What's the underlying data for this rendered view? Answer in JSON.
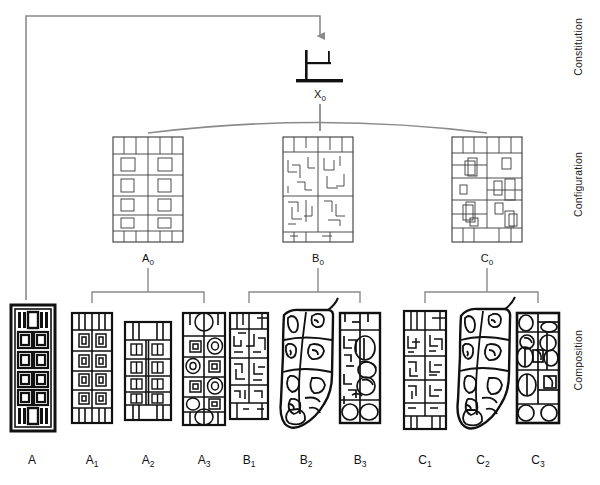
{
  "diagram": {
    "stroke_gray": "#8a8a8a",
    "stroke_dark": "#1a1a1a",
    "background": "#ffffff"
  },
  "levels": [
    {
      "key": "constitution",
      "label": "Constitution",
      "x": 574,
      "y": 18,
      "height": 96
    },
    {
      "key": "configuration",
      "label": "Configuration",
      "x": 574,
      "y": 152,
      "height": 98
    },
    {
      "key": "composition",
      "label": "Composition",
      "x": 574,
      "y": 330,
      "height": 92
    }
  ],
  "root": {
    "name": "X0",
    "label": "X",
    "subscript": "0",
    "label_x": 320,
    "label_y": 90,
    "glyph_x": 320,
    "glyph_y": 68
  },
  "configuration_nodes": [
    {
      "name": "A0",
      "label": "A",
      "subscript": "0",
      "cx": 148,
      "label_y": 258,
      "panel_x": 113,
      "panel_y": 137,
      "panel_w": 70,
      "panel_h": 105,
      "style": "orthogonal-regular"
    },
    {
      "name": "B0",
      "label": "B",
      "subscript": "0",
      "cx": 318,
      "label_y": 258,
      "panel_x": 283,
      "panel_y": 137,
      "panel_w": 70,
      "panel_h": 105,
      "style": "orthogonal-irregular"
    },
    {
      "name": "C0",
      "label": "C",
      "subscript": "0",
      "cx": 487,
      "label_y": 258,
      "panel_x": 452,
      "panel_y": 137,
      "panel_w": 70,
      "panel_h": 105,
      "style": "orthogonal-mixed"
    }
  ],
  "composition_nodes": [
    {
      "name": "A",
      "label": "A",
      "subscript": "",
      "cx": 32,
      "panel_x": 11,
      "panel_y": 305,
      "panel_w": 44,
      "panel_h": 126,
      "style": "bold-nested",
      "parent": null,
      "label_y": 458
    },
    {
      "name": "A1",
      "label": "A",
      "subscript": "1",
      "cx": 92,
      "panel_x": 72,
      "panel_y": 313,
      "panel_w": 40,
      "panel_h": 110,
      "style": "rect-grid",
      "parent": "A0",
      "label_y": 458
    },
    {
      "name": "A2",
      "label": "A",
      "subscript": "2",
      "cx": 148,
      "panel_x": 125,
      "panel_y": 322,
      "panel_w": 46,
      "panel_h": 98,
      "style": "rect-grid-split",
      "parent": "A0",
      "label_y": 458
    },
    {
      "name": "A3",
      "label": "A",
      "subscript": "3",
      "cx": 204,
      "panel_x": 183,
      "panel_y": 313,
      "panel_w": 42,
      "panel_h": 112,
      "style": "rect-oval-mix",
      "parent": "A0",
      "label_y": 458
    },
    {
      "name": "B1",
      "label": "B",
      "subscript": "1",
      "cx": 249,
      "panel_x": 230,
      "panel_y": 313,
      "panel_w": 38,
      "panel_h": 106,
      "style": "maze-ortho",
      "parent": "B0",
      "label_y": 458
    },
    {
      "name": "B2",
      "label": "B",
      "subscript": "2",
      "cx": 306,
      "panel_x": 277,
      "panel_y": 308,
      "panel_w": 58,
      "panel_h": 124,
      "style": "organic-blob",
      "parent": "B0",
      "label_y": 458
    },
    {
      "name": "B3",
      "label": "B",
      "subscript": "3",
      "cx": 360,
      "panel_x": 340,
      "panel_y": 313,
      "panel_w": 40,
      "panel_h": 110,
      "style": "organic-ortho",
      "parent": "B0",
      "label_y": 458
    },
    {
      "name": "C1",
      "label": "C",
      "subscript": "1",
      "cx": 425,
      "panel_x": 404,
      "panel_y": 311,
      "panel_w": 42,
      "panel_h": 118,
      "style": "maze-ortho",
      "parent": "C0",
      "label_y": 458
    },
    {
      "name": "C2",
      "label": "C",
      "subscript": "2",
      "cx": 483,
      "panel_x": 455,
      "panel_y": 308,
      "panel_w": 57,
      "panel_h": 124,
      "style": "organic-blob",
      "parent": "C0",
      "label_y": 458
    },
    {
      "name": "C3",
      "label": "C",
      "subscript": "3",
      "cx": 538,
      "panel_x": 517,
      "panel_y": 313,
      "panel_w": 42,
      "panel_h": 110,
      "style": "organic-oval",
      "parent": "C0",
      "label_y": 458
    }
  ],
  "connectors": {
    "feedback": {
      "name": "feedback-loop",
      "from_x": 26,
      "from_y": 300,
      "top_y": 16,
      "to_x": 320,
      "arrow_tip_y": 44
    },
    "root_stem": {
      "x": 320,
      "y1": 104,
      "y2": 131
    },
    "config_arc": {
      "x1": 148,
      "x2": 487,
      "y_end": 131,
      "y_peak": 118
    },
    "brackets": [
      {
        "name": "A0-bracket",
        "cx": 148,
        "left_x": 92,
        "right_x": 204,
        "top_y": 268,
        "bar_y": 292,
        "drop_y": 303
      },
      {
        "name": "B0-bracket",
        "cx": 318,
        "left_x": 249,
        "right_x": 360,
        "top_y": 268,
        "bar_y": 292,
        "drop_y": 303
      },
      {
        "name": "C0-bracket",
        "cx": 487,
        "left_x": 425,
        "right_x": 538,
        "top_y": 268,
        "bar_y": 292,
        "drop_y": 303
      }
    ]
  }
}
